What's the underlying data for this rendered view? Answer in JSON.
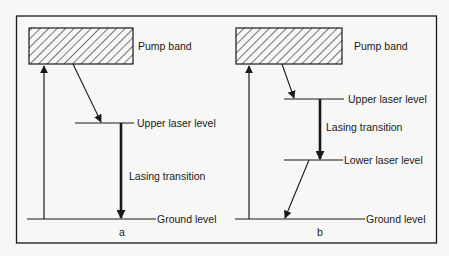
{
  "diagram": {
    "type": "energy-level",
    "colors": {
      "ink": "#1a1a1a",
      "background": "#f7f7f5"
    },
    "panels": [
      {
        "caption": "a",
        "labels": {
          "pump_band": "Pump band",
          "upper_laser_level": "Upper laser level",
          "lasing_transition": "Lasing transition",
          "ground_level": "Ground level"
        }
      },
      {
        "caption": "b",
        "labels": {
          "pump_band": "Pump band",
          "upper_laser_level": "Upper laser level",
          "lasing_transition": "Lasing transition",
          "lower_laser_level": "Lower laser level",
          "ground_level": "Ground level"
        }
      }
    ]
  }
}
